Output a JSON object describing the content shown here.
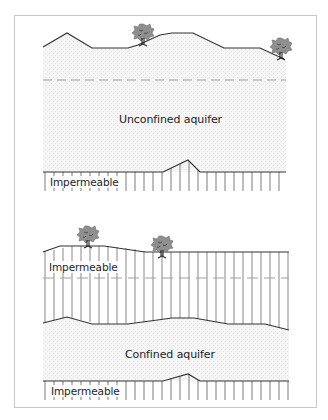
{
  "diagram": {
    "upper_panel": {
      "aquifer_label": "Unconfined aquifer",
      "base_label": "Impermeable",
      "trees": 2
    },
    "lower_panel": {
      "cap_label": "Impermeable",
      "aquifer_label": "Confined aquifer",
      "base_label": "Impermeable",
      "trees": 2
    },
    "colors": {
      "line": "#333333",
      "stipple": "#f2f2f2",
      "stripe": "#9a9a9a",
      "dash": "#a0a0a0",
      "tree": "#8c8c8c",
      "frame": "#c8c8c8"
    }
  }
}
